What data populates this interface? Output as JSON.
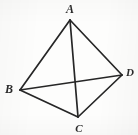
{
  "figure": {
    "kind": "geometry-diagram",
    "width": 138,
    "height": 135,
    "background_color": "#fdfdfc",
    "ink_color": "#262626",
    "label_color": "#2b2b2b",
    "stroke_width": 1.7
  },
  "vertices": [
    {
      "id": "A",
      "label": "A",
      "x": 70,
      "y": 20,
      "label_x": 70,
      "label_y": 9
    },
    {
      "id": "B",
      "label": "B",
      "x": 20,
      "y": 90,
      "label_x": 9,
      "label_y": 89
    },
    {
      "id": "C",
      "label": "C",
      "x": 78,
      "y": 117,
      "label_x": 79,
      "label_y": 128
    },
    {
      "id": "D",
      "label": "D",
      "x": 122,
      "y": 75,
      "label_x": 130,
      "label_y": 72
    }
  ],
  "edges": [
    {
      "id": "AB",
      "from": "A",
      "to": "B",
      "role": "side",
      "x1": 70,
      "y1": 20,
      "x2": 20,
      "y2": 90
    },
    {
      "id": "AD",
      "from": "A",
      "to": "D",
      "role": "side",
      "x1": 70,
      "y1": 20,
      "x2": 122,
      "y2": 75
    },
    {
      "id": "BC",
      "from": "B",
      "to": "C",
      "role": "side",
      "x1": 20,
      "y1": 90,
      "x2": 78,
      "y2": 117
    },
    {
      "id": "CD",
      "from": "C",
      "to": "D",
      "role": "side",
      "x1": 78,
      "y1": 117,
      "x2": 122,
      "y2": 75
    },
    {
      "id": "AC",
      "from": "A",
      "to": "C",
      "role": "diagonal",
      "x1": 70,
      "y1": 20,
      "x2": 78,
      "y2": 117
    },
    {
      "id": "BD",
      "from": "B",
      "to": "D",
      "role": "diagonal",
      "x1": 20,
      "y1": 90,
      "x2": 122,
      "y2": 75
    }
  ],
  "intersection": {
    "id": "diagonal-crossing",
    "x": 76,
    "y": 82
  }
}
